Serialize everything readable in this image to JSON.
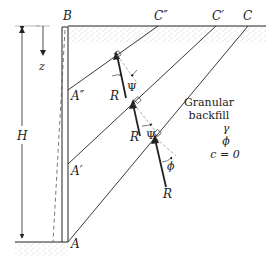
{
  "figure": {
    "type": "retaining-wall-trial-wedge-diagram",
    "points": {
      "B": "B",
      "C_double_prime": "C″",
      "C_prime": "C′",
      "C": "C",
      "A_double_prime": "A″",
      "A_prime": "A′",
      "A": "A"
    },
    "dimensions": {
      "height": "H",
      "depth": "z"
    },
    "forces": {
      "R1": "R",
      "R2": "R",
      "R3": "R"
    },
    "angles": {
      "psi1": "Ψ",
      "psi2": "Ψ",
      "phi": "ϕ"
    },
    "backfill": {
      "title_line1": "Granular",
      "title_line2": "backfill",
      "gamma": "γ",
      "phi": "ϕ",
      "cohesion": "c = 0"
    }
  },
  "colors": {
    "line": "#222222",
    "dashed": "#888888",
    "stipple": "#9a9a9a"
  }
}
